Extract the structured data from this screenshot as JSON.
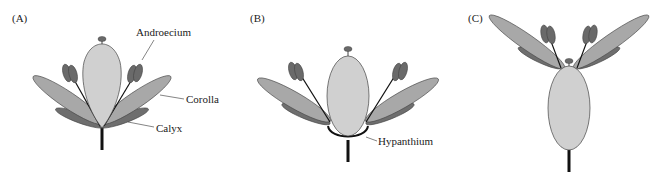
{
  "panels": [
    {
      "id": "A",
      "label": "(A)",
      "annotations": [
        "Androecium",
        "Corolla",
        "Calyx"
      ]
    },
    {
      "id": "B",
      "label": "(B)",
      "annotations": [
        "Hypanthium"
      ]
    },
    {
      "id": "C",
      "label": "(C)",
      "annotations": []
    }
  ],
  "colors": {
    "ovary": "#d0d0d0",
    "petal": "#a8a8a8",
    "sepal": "#6e6e6e",
    "anther": "#6a6a6a",
    "outline": "#444444",
    "stem": "#111111"
  }
}
